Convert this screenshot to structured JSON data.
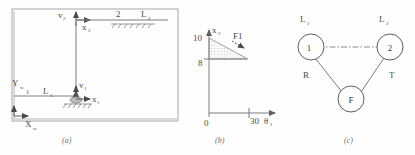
{
  "figure": {
    "width": 415,
    "height": 155,
    "background": "#fefefe",
    "line_color": "#7d7d7d",
    "text_color": "#4a4a4a"
  },
  "panel_a": {
    "caption": "(a)",
    "global_axes": {
      "y_label": "Y",
      "y_sub": "w",
      "x_label": "X",
      "x_sub": "w"
    },
    "joint1": {
      "v_label": "v",
      "v_sub": "1",
      "x_label": "x",
      "x_sub": "1"
    },
    "joint2": {
      "v_label": "v",
      "v_sub": "2",
      "x_label": "x",
      "x_sub": "2"
    },
    "link1": {
      "number": "1",
      "length_label": "L",
      "length_sub": "1"
    },
    "link2": {
      "number": "2",
      "length_label": "L",
      "length_sub": "2"
    }
  },
  "panel_b": {
    "caption": "(b)",
    "y_axis_label": "x",
    "y_axis_sub": "2",
    "x_axis_label": "θ",
    "x_axis_sub": "1",
    "y_ticks": [
      "10",
      "8"
    ],
    "x_ticks": [
      "0",
      "30"
    ],
    "force_label": "F1"
  },
  "panel_c": {
    "caption": "(c)",
    "nodes": [
      {
        "id": "node-1",
        "label": "1"
      },
      {
        "id": "node-2",
        "label": "2"
      },
      {
        "id": "node-f",
        "label": "F"
      }
    ],
    "node_labels": [
      {
        "id": "label-l1",
        "text": "L",
        "sub": "1"
      },
      {
        "id": "label-l2",
        "text": "L",
        "sub": "2"
      }
    ],
    "edges": [
      {
        "id": "edge-r",
        "label": "R"
      },
      {
        "id": "edge-t",
        "label": "T"
      }
    ]
  }
}
